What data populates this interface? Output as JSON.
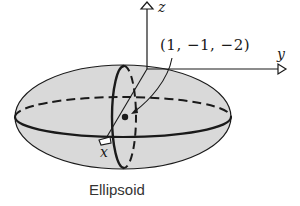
{
  "diagram": {
    "caption": "Ellipsoid",
    "point_label": "(1, −1, −2)",
    "axes": {
      "x": "x",
      "y": "y",
      "z": "z"
    },
    "colors": {
      "fill": "#d9d9d9",
      "stroke": "#1a1a1a",
      "background": "#ffffff"
    }
  }
}
